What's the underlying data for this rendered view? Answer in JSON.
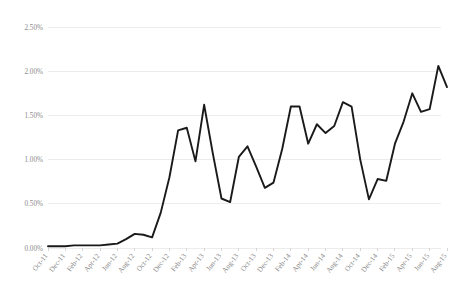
{
  "chart_data": {
    "type": "line",
    "title": "",
    "subtitle": "",
    "xlabel": "",
    "ylabel": "",
    "grid": true,
    "legend": false,
    "legend_position": "none",
    "ylim": [
      0.0,
      2.5
    ],
    "ytick_values": [
      0.0,
      0.5,
      1.0,
      1.5,
      2.0,
      2.5
    ],
    "ytick_labels": [
      "0.00%",
      "0.50%",
      "1.00%",
      "1.50%",
      "2.00%",
      "2.50%"
    ],
    "xtick_labels": [
      "Oct-11",
      "Dec-11",
      "Feb-12",
      "Apr-12",
      "Jun-12",
      "Aug-12",
      "Oct-12",
      "Dec-12",
      "Feb-13",
      "Apr-13",
      "Jun-13",
      "Aug-13",
      "Oct-13",
      "Dec-13",
      "Feb-14",
      "Apr-14",
      "Jun-14",
      "Aug-14",
      "Oct-14",
      "Dec-14",
      "Feb-15",
      "Apr-15",
      "Jun-15",
      "Aug-15"
    ],
    "x": [
      "Oct-11",
      "Nov-11",
      "Dec-11",
      "Jan-12",
      "Feb-12",
      "Mar-12",
      "Apr-12",
      "May-12",
      "Jun-12",
      "Jul-12",
      "Aug-12",
      "Sep-12",
      "Oct-12",
      "Nov-12",
      "Dec-12",
      "Jan-13",
      "Feb-13",
      "Mar-13",
      "Apr-13",
      "May-13",
      "Jun-13",
      "Jul-13",
      "Aug-13",
      "Sep-13",
      "Oct-13",
      "Nov-13",
      "Dec-13",
      "Jan-14",
      "Feb-14",
      "Mar-14",
      "Apr-14",
      "May-14",
      "Jun-14",
      "Jul-14",
      "Aug-14",
      "Sep-14",
      "Oct-14",
      "Nov-14",
      "Dec-14",
      "Jan-15",
      "Feb-15",
      "Mar-15",
      "Apr-15",
      "May-15",
      "Jun-15",
      "Jul-15",
      "Aug-15"
    ],
    "values": [
      0.02,
      0.02,
      0.02,
      0.03,
      0.03,
      0.03,
      0.03,
      0.04,
      0.05,
      0.1,
      0.16,
      0.15,
      0.12,
      0.4,
      0.8,
      1.33,
      1.36,
      0.98,
      1.62,
      1.07,
      0.56,
      0.52,
      1.03,
      1.15,
      0.92,
      0.68,
      0.74,
      1.12,
      1.6,
      1.6,
      1.18,
      1.4,
      1.3,
      1.38,
      1.65,
      1.6,
      1.0,
      0.55,
      0.78,
      0.76,
      1.18,
      1.43,
      1.75,
      1.54,
      1.57,
      2.06,
      1.82
    ],
    "series": [
      {
        "name": "series-1",
        "color": "#1a1a1a",
        "values": [
          0.02,
          0.02,
          0.02,
          0.03,
          0.03,
          0.03,
          0.03,
          0.04,
          0.05,
          0.1,
          0.16,
          0.15,
          0.12,
          0.4,
          0.8,
          1.33,
          1.36,
          0.98,
          1.62,
          1.07,
          0.56,
          0.52,
          1.03,
          1.15,
          0.92,
          0.68,
          0.74,
          1.12,
          1.6,
          1.6,
          1.18,
          1.4,
          1.3,
          1.38,
          1.65,
          1.6,
          1.0,
          0.55,
          0.78,
          0.76,
          1.18,
          1.43,
          1.75,
          1.54,
          1.57,
          2.06,
          1.82
        ]
      }
    ]
  },
  "axes": {
    "y_unit": "%",
    "x_min_label": "Oct-11",
    "x_max_label": "Aug-15"
  }
}
